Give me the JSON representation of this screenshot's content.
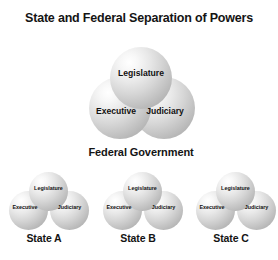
{
  "title": "State and Federal Separation of Powers",
  "branch_labels": {
    "legislature": "Legislature",
    "executive": "Executive",
    "judiciary": "Judiciary"
  },
  "federal": {
    "caption": "Federal Government",
    "legislature": "Legislature",
    "executive": "Executive",
    "judiciary": "Judiciary"
  },
  "states": [
    {
      "caption": "State A",
      "legislature": "Legislature",
      "executive": "Executive",
      "judiciary": "Judiciary"
    },
    {
      "caption": "State B",
      "legislature": "Legislature",
      "executive": "Executive",
      "judiciary": "Judiciary"
    },
    {
      "caption": "State C",
      "legislature": "Legislature",
      "executive": "Executive",
      "judiciary": "Judiciary"
    }
  ],
  "colors": {
    "background": "#ffffff",
    "text": "#141414",
    "sphere_highlight": "#ffffff",
    "sphere_shadow": "#a6a6a6"
  }
}
